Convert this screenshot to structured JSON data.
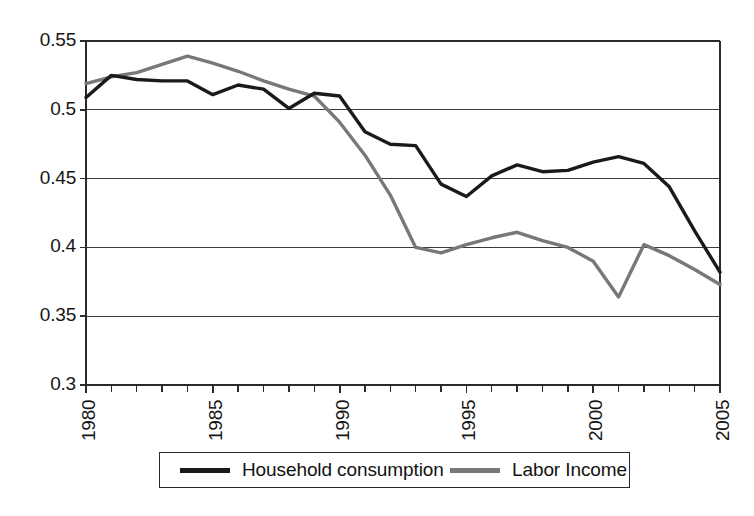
{
  "chart_data": {
    "type": "line",
    "title": "",
    "subtitle": "",
    "xlabel": "",
    "ylabel": "",
    "xlim": [
      1980,
      2005
    ],
    "ylim": [
      0.3,
      0.55
    ],
    "grid": true,
    "grid_axis": "y",
    "legend_position": "bottom",
    "x": [
      1980,
      1981,
      1982,
      1983,
      1984,
      1985,
      1986,
      1987,
      1988,
      1989,
      1990,
      1991,
      1992,
      1993,
      1994,
      1995,
      1996,
      1997,
      1998,
      1999,
      2000,
      2001,
      2002,
      2003,
      2004,
      2005
    ],
    "ytick_labels": [
      "0.55",
      "0.5",
      "0.45",
      "0.4",
      "0.35",
      "0.3"
    ],
    "ytick_values": [
      0.55,
      0.5,
      0.45,
      0.4,
      0.35,
      0.3
    ],
    "xtick_labels": [
      "1980",
      "1985",
      "1990",
      "1995",
      "2000",
      "2005"
    ],
    "xtick_values": [
      1980,
      1985,
      1990,
      1995,
      2000,
      2005
    ],
    "minor_xticks": [
      1981,
      1982,
      1983,
      1984,
      1986,
      1987,
      1988,
      1989,
      1991,
      1992,
      1993,
      1994,
      1996,
      1997,
      1998,
      1999,
      2001,
      2002,
      2003,
      2004
    ],
    "series": [
      {
        "name": "Household consumption",
        "color": "#1a1a1a",
        "linewidth": 3.4,
        "values": [
          0.509,
          0.525,
          0.522,
          0.521,
          0.521,
          0.511,
          0.518,
          0.515,
          0.501,
          0.512,
          0.51,
          0.484,
          0.475,
          0.474,
          0.446,
          0.437,
          0.452,
          0.46,
          0.455,
          0.456,
          0.462,
          0.466,
          0.461,
          0.444,
          0.412,
          0.382
        ]
      },
      {
        "name": "Labor Income",
        "color": "#787878",
        "linewidth": 3.4,
        "values": [
          0.519,
          0.524,
          0.527,
          0.533,
          0.539,
          0.534,
          0.528,
          0.521,
          0.515,
          0.51,
          0.491,
          0.467,
          0.438,
          0.4,
          0.396,
          0.402,
          0.407,
          0.411,
          0.405,
          0.4,
          0.39,
          0.364,
          0.402,
          0.394,
          0.384,
          0.373
        ]
      }
    ]
  },
  "legend": {
    "entries": [
      {
        "label": "Household consumption",
        "color": "#1a1a1a"
      },
      {
        "label": "Labor Income",
        "color": "#787878"
      }
    ]
  },
  "axis": {
    "y_labels": [
      "0.55",
      "0.5",
      "0.45",
      "0.4",
      "0.35",
      "0.3"
    ],
    "x_labels": [
      "1980",
      "1985",
      "1990",
      "1995",
      "2000",
      "2005"
    ]
  }
}
